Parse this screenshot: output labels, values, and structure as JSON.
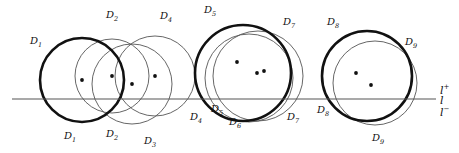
{
  "figure": {
    "type": "geometry-diagram",
    "width": 459,
    "height": 153,
    "background": "#ffffff",
    "stroke_thick": "#111111",
    "stroke_thin": "#555555",
    "dot_color": "#111111",
    "line_color": "#555555"
  },
  "line": {
    "name": "l",
    "y": 99,
    "x_start": 12,
    "x_end": 436,
    "label": "l",
    "label_upper": "l",
    "label_upper_sup": "+",
    "label_lower": "l",
    "label_lower_sup": "−"
  },
  "axis_labels": [
    {
      "id": "l-plus",
      "text": "l",
      "sup": "+",
      "x": 440,
      "y": 84
    },
    {
      "id": "l",
      "text": "l",
      "sup": "",
      "x": 440,
      "y": 95
    },
    {
      "id": "l-minus",
      "text": "l",
      "sup": "−",
      "x": 440,
      "y": 106
    }
  ],
  "disks": [
    {
      "id": "D1",
      "label": "D",
      "sub": "1",
      "cx": 82,
      "cy": 80,
      "r": 42,
      "weight": "thick"
    },
    {
      "id": "D2",
      "label": "D",
      "sub": "2",
      "cx": 112,
      "cy": 76,
      "r": 37,
      "weight": "thin"
    },
    {
      "id": "D3",
      "label": "D",
      "sub": "3",
      "cx": 132,
      "cy": 84,
      "r": 40,
      "weight": "thin"
    },
    {
      "id": "D4",
      "label": "D",
      "sub": "4",
      "cx": 155,
      "cy": 76,
      "r": 40,
      "weight": "thin"
    },
    {
      "id": "D5",
      "label": "D",
      "sub": "5",
      "cx": 243,
      "cy": 73,
      "r": 48,
      "weight": "thick"
    },
    {
      "id": "D6",
      "label": "D",
      "sub": "6",
      "cx": 249,
      "cy": 78,
      "r": 44,
      "weight": "thin"
    },
    {
      "id": "D7",
      "label": "D",
      "sub": "7",
      "cx": 258,
      "cy": 76,
      "r": 45,
      "weight": "thin"
    },
    {
      "id": "D8",
      "label": "D",
      "sub": "8",
      "cx": 367,
      "cy": 76,
      "r": 45,
      "weight": "thick"
    },
    {
      "id": "D9",
      "label": "D",
      "sub": "9",
      "cx": 375,
      "cy": 83,
      "r": 42,
      "weight": "thin"
    }
  ],
  "centers": [
    {
      "id": "c1",
      "cx": 82,
      "cy": 80
    },
    {
      "id": "c2",
      "cx": 112,
      "cy": 76
    },
    {
      "id": "c3",
      "cx": 132,
      "cy": 84
    },
    {
      "id": "c4",
      "cx": 155,
      "cy": 76
    },
    {
      "id": "c5",
      "cx": 237,
      "cy": 62
    },
    {
      "id": "c6",
      "cx": 257,
      "cy": 73
    },
    {
      "id": "c7",
      "cx": 264,
      "cy": 71
    },
    {
      "id": "c8",
      "cx": 356,
      "cy": 73
    },
    {
      "id": "c9",
      "cx": 371,
      "cy": 85
    }
  ],
  "disk_labels": [
    {
      "id": "lbl-D1-top",
      "text": "D",
      "sub": "1",
      "x": 30,
      "y": 36
    },
    {
      "id": "lbl-D2-top",
      "text": "D",
      "sub": "2",
      "x": 106,
      "y": 10
    },
    {
      "id": "lbl-D4-top",
      "text": "D",
      "sub": "4",
      "x": 160,
      "y": 11
    },
    {
      "id": "lbl-D5-top",
      "text": "D",
      "sub": "5",
      "x": 204,
      "y": 5
    },
    {
      "id": "lbl-D7-top",
      "text": "D",
      "sub": "7",
      "x": 283,
      "y": 17
    },
    {
      "id": "lbl-D8-top",
      "text": "D",
      "sub": "8",
      "x": 327,
      "y": 17
    },
    {
      "id": "lbl-D9-top",
      "text": "D",
      "sub": "9",
      "x": 405,
      "y": 37
    },
    {
      "id": "lbl-D1-bottom",
      "text": "D",
      "sub": "1",
      "x": 64,
      "y": 131
    },
    {
      "id": "lbl-D2-bottom",
      "text": "D",
      "sub": "2",
      "x": 106,
      "y": 129
    },
    {
      "id": "lbl-D3-bottom",
      "text": "D",
      "sub": "3",
      "x": 144,
      "y": 136
    },
    {
      "id": "lbl-D4-bottom",
      "text": "D",
      "sub": "4",
      "x": 190,
      "y": 112
    },
    {
      "id": "lbl-D5-bottom",
      "text": "D",
      "sub": "5",
      "x": 211,
      "y": 104
    },
    {
      "id": "lbl-D6-bottom",
      "text": "D",
      "sub": "6",
      "x": 229,
      "y": 117
    },
    {
      "id": "lbl-D7-bottom",
      "text": "D",
      "sub": "7",
      "x": 287,
      "y": 112
    },
    {
      "id": "lbl-D8-bottom",
      "text": "D",
      "sub": "8",
      "x": 317,
      "y": 105
    },
    {
      "id": "lbl-D9-bottom",
      "text": "D",
      "sub": "9",
      "x": 372,
      "y": 133
    }
  ]
}
